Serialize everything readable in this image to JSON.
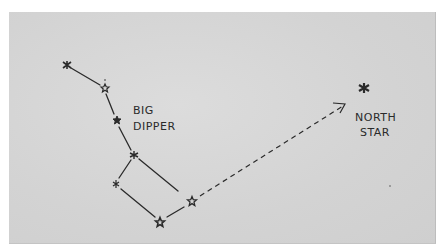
{
  "diagram": {
    "colors": {
      "background": "#d6d6d6",
      "ink": "#2a2a2a",
      "page": "#ffffff"
    },
    "labels": {
      "big_dipper": [
        "BIG",
        "DIPPER"
      ],
      "north_star": [
        "NORTH",
        "STAR"
      ]
    },
    "big_dipper_stars": [
      {
        "id": "handle-end",
        "x": 67,
        "y": 65
      },
      {
        "id": "handle-mid",
        "x": 105,
        "y": 88
      },
      {
        "id": "handle-inner",
        "x": 117,
        "y": 120
      },
      {
        "id": "bowl-top-left",
        "x": 134,
        "y": 155
      },
      {
        "id": "bowl-bottom-left",
        "x": 116,
        "y": 184
      },
      {
        "id": "bowl-bottom-right",
        "x": 160,
        "y": 222
      },
      {
        "id": "bowl-pointer",
        "x": 192,
        "y": 201
      }
    ],
    "north_star": {
      "x": 364,
      "y": 88
    },
    "pointer_arrow": {
      "from": [
        200,
        196
      ],
      "to": [
        345,
        105
      ],
      "style": "dashed"
    }
  }
}
